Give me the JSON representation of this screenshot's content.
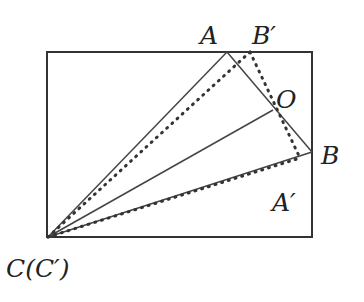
{
  "diagram": {
    "title": "",
    "rectangle": {
      "x1": 47,
      "y1": 52,
      "x2": 312,
      "y2": 237
    },
    "points": {
      "A": {
        "label": "A",
        "x": 227,
        "y": 52
      },
      "B_prime": {
        "label": "B′",
        "x": 250,
        "y": 52
      },
      "O": {
        "label": "O",
        "x": 273,
        "y": 110
      },
      "B": {
        "label": "B",
        "x": 312,
        "y": 152
      },
      "A_prime": {
        "label": "A′",
        "x": 300,
        "y": 158
      },
      "C": {
        "label": "C(C′)",
        "x": 48,
        "y": 237
      }
    },
    "labels": {
      "A": "A",
      "B_prime": "B′",
      "O": "O",
      "B": "B",
      "A_prime": "A′",
      "C": "C(C′)"
    },
    "colors": {
      "stroke": "#333333",
      "text": "#222222"
    }
  }
}
